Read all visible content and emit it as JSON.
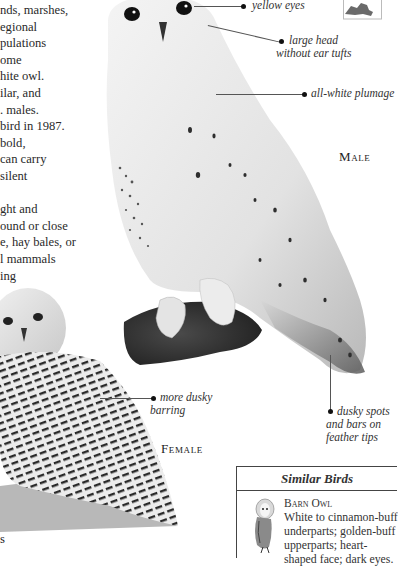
{
  "body_text": {
    "lines": [
      "nds, marshes,",
      "egional",
      "pulations",
      "ome",
      "hite owl.",
      "ilar, and",
      ". males.",
      "bird in 1987.",
      " bold,",
      " can carry",
      "silent",
      "",
      "ght and",
      "ound or close",
      "e, hay bales, or",
      "l mammals",
      "ing"
    ],
    "bottom_fragment": "s"
  },
  "annotations": {
    "yellow_eyes": "yellow eyes",
    "large_head_1": "large head",
    "large_head_2": "without ear tufts",
    "plumage": "all-white plumage",
    "dusky_barring_1": "more dusky",
    "dusky_barring_2": "barring",
    "dusky_spots_1": "dusky spots",
    "dusky_spots_2": "and bars on",
    "dusky_spots_3": "feather tips"
  },
  "captions": {
    "male": "Male",
    "female": "Female"
  },
  "similar_birds": {
    "title": "Similar Birds",
    "items": [
      {
        "name": "Barn Owl",
        "lines": [
          "White to cinnamon-buff",
          "underparts; golden-buff",
          "upperparts; heart-",
          "shaped face; dark eyes."
        ]
      }
    ]
  },
  "colors": {
    "text": "#222222",
    "leader_line": "#555555",
    "box_border": "#444444"
  }
}
